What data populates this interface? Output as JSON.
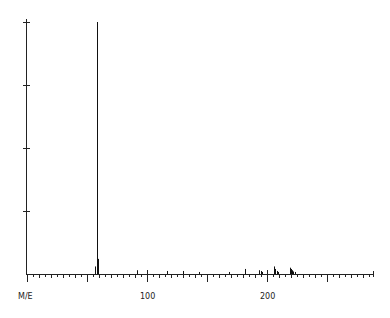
{
  "chart_data": {
    "type": "bar",
    "title": "",
    "xlabel": "M/E",
    "ylabel": "",
    "xlim": [
      0,
      288
    ],
    "ylim": [
      0,
      100
    ],
    "x_ticks_labeled": [
      100,
      200
    ],
    "y_ticks": [
      0,
      25,
      50,
      75,
      100
    ],
    "grid": false,
    "legend": null,
    "peaks": [
      {
        "mz": 57,
        "intensity": 3
      },
      {
        "mz": 58,
        "intensity": 100
      },
      {
        "mz": 59,
        "intensity": 6
      },
      {
        "mz": 92,
        "intensity": 1.5
      },
      {
        "mz": 117,
        "intensity": 1.2
      },
      {
        "mz": 130,
        "intensity": 1.2
      },
      {
        "mz": 143,
        "intensity": 0.8
      },
      {
        "mz": 168,
        "intensity": 0.8
      },
      {
        "mz": 182,
        "intensity": 2
      },
      {
        "mz": 193,
        "intensity": 1.5
      },
      {
        "mz": 195,
        "intensity": 1.2
      },
      {
        "mz": 196,
        "intensity": 0.8
      },
      {
        "mz": 206,
        "intensity": 3
      },
      {
        "mz": 207,
        "intensity": 2
      },
      {
        "mz": 208,
        "intensity": 1.2
      },
      {
        "mz": 209,
        "intensity": 0.8
      },
      {
        "mz": 219,
        "intensity": 2.5
      },
      {
        "mz": 220,
        "intensity": 2
      },
      {
        "mz": 221,
        "intensity": 1.5
      },
      {
        "mz": 222,
        "intensity": 1
      },
      {
        "mz": 223,
        "intensity": 0.8
      }
    ]
  },
  "labels": {
    "x_axis": "M/E",
    "tick_100": "100",
    "tick_200": "200"
  }
}
